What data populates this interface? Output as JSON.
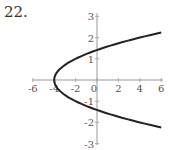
{
  "problem_number": "22.",
  "chart_data": {
    "type": "line",
    "title": "",
    "xlabel": "",
    "ylabel": "",
    "xlim": [
      -6,
      6
    ],
    "ylim": [
      -3,
      3
    ],
    "grid": false,
    "x_ticks": [
      "-6",
      "-4",
      "-2",
      "0",
      "2",
      "4",
      "6"
    ],
    "y_ticks": [
      "3",
      "2",
      "1",
      "-1",
      "-2",
      "-3"
    ],
    "curve": "x = 2y^2 - 4 (parabola opening right, vertex at (-4, 0))",
    "series": [
      {
        "name": "parabola",
        "color": "#222222",
        "points": [
          [
            6,
            2.24
          ],
          [
            4,
            2.0
          ],
          [
            2,
            1.73
          ],
          [
            0,
            1.41
          ],
          [
            -2,
            1.0
          ],
          [
            -3,
            0.71
          ],
          [
            -4,
            0
          ],
          [
            -3,
            -0.71
          ],
          [
            -2,
            -1.0
          ],
          [
            0,
            -1.41
          ],
          [
            2,
            -1.73
          ],
          [
            4,
            -2.0
          ],
          [
            6,
            -2.24
          ]
        ]
      }
    ]
  }
}
